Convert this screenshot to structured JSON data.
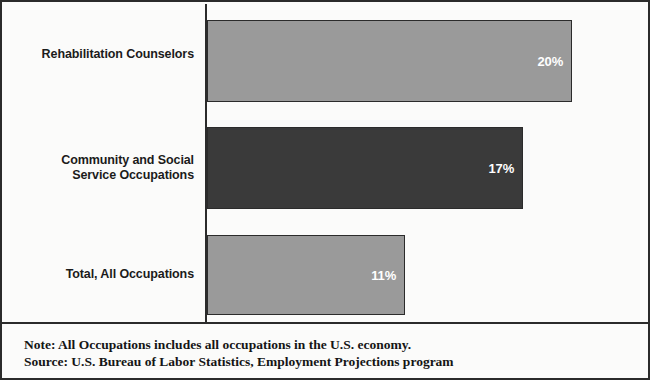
{
  "chart_data": {
    "type": "bar",
    "orientation": "horizontal",
    "title": "",
    "subtitle": "",
    "xlabel": "",
    "ylabel": "",
    "categories": [
      "Rehabilitation Counselors",
      "Community and Social Service Occupations",
      "Total, All Occupations"
    ],
    "values": [
      20,
      17,
      11
    ],
    "value_labels": [
      "20%",
      "17%",
      "11%"
    ],
    "xlim": [
      0,
      22
    ],
    "grid": false,
    "legend": null,
    "series": [
      {
        "name": "Percent change",
        "values": [
          20,
          17,
          11
        ]
      }
    ],
    "bar_colors": [
      "#9a9a9a",
      "#3a3a3a",
      "#9a9a9a"
    ],
    "annotations": [
      "Note: All Occupations includes all occupations in the U.S. economy.",
      "Source: U.S. Bureau of Labor Statistics, Employment Projections program"
    ]
  },
  "rows": [
    {
      "label_line1": "Rehabilitation Counselors",
      "label_line2": "",
      "value_label": "20%"
    },
    {
      "label_line1": "Community and Social",
      "label_line2": "Service Occupations",
      "value_label": "17%"
    },
    {
      "label_line1": "Total, All Occupations",
      "label_line2": "",
      "value_label": "11%"
    }
  ],
  "footnotes": {
    "note": "Note: All Occupations includes all occupations in the U.S. economy.",
    "source": "Source: U.S. Bureau of Labor Statistics, Employment Projections program"
  },
  "colors": {
    "bar_light": "#9a9a9a",
    "bar_dark": "#3a3a3a",
    "axis": "#2b2b2b",
    "background": "#fbfbfa",
    "value_label": "#ffffff"
  }
}
